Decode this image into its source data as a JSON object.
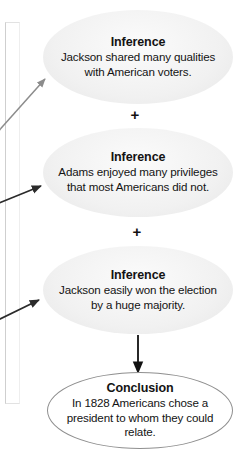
{
  "diagram": {
    "type": "inference-conclusion-flow",
    "nodes": [
      {
        "id": "inference-1",
        "title": "Inference",
        "body": "Jackson shared many qualities with American voters.",
        "shape": "ellipse",
        "fill": "#f1f1f1",
        "border": "#1d1d1d"
      },
      {
        "id": "inference-2",
        "title": "Inference",
        "body": "Adams enjoyed many privileges that most Americans did not.",
        "shape": "ellipse",
        "fill": "#f1f1f1",
        "border": "#1d1d1d"
      },
      {
        "id": "inference-3",
        "title": "Inference",
        "body": "Jackson easily won the election by a huge majority.",
        "shape": "ellipse",
        "fill": "#f1f1f1",
        "border": "#1d1d1d"
      },
      {
        "id": "conclusion",
        "title": "Conclusion",
        "body": "In 1828 Americans chose a president to whom they could relate.",
        "shape": "ellipse",
        "fill": "#ffffff",
        "border": "#8f8f8f"
      }
    ],
    "operators": [
      {
        "id": "plus-1",
        "symbol": "+"
      },
      {
        "id": "plus-2",
        "symbol": "+"
      }
    ],
    "connectors": [
      {
        "id": "arrow-in-1",
        "from": "offscreen-left",
        "to": "inference-1",
        "style": "diagonal",
        "color": "#8c8c8c"
      },
      {
        "id": "arrow-in-2",
        "from": "offscreen-left",
        "to": "inference-2",
        "style": "diagonal",
        "color": "#2b2b2b"
      },
      {
        "id": "arrow-in-3",
        "from": "offscreen-left",
        "to": "inference-3",
        "style": "diagonal",
        "color": "#2b2b2b"
      },
      {
        "id": "arrow-to-conclusion",
        "from": "inference-3",
        "to": "conclusion",
        "style": "vertical",
        "color": "#111111"
      }
    ]
  }
}
